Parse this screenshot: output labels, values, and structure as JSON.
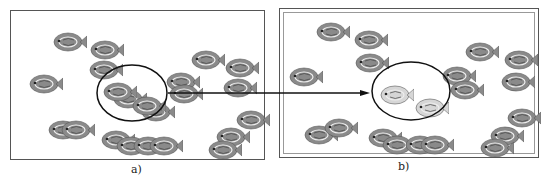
{
  "panels": [
    {
      "id": "a",
      "label": "a)"
    },
    {
      "id": "b",
      "label": "b)"
    }
  ],
  "colors": {
    "fish_normal": "#8a8a8a",
    "fish_faded": "#d6d6d6",
    "outline": "#111111"
  },
  "fish_a": [
    [
      42,
      20
    ],
    [
      79,
      28
    ],
    [
      78,
      48
    ],
    [
      18,
      62
    ],
    [
      180,
      38
    ],
    [
      214,
      46
    ],
    [
      212,
      66
    ],
    [
      155,
      60
    ],
    [
      158,
      72
    ],
    [
      102,
      77
    ],
    [
      130,
      90
    ],
    [
      37,
      108
    ],
    [
      50,
      108
    ],
    [
      90,
      118
    ],
    [
      105,
      124
    ],
    [
      122,
      124
    ],
    [
      138,
      124
    ],
    [
      225,
      98
    ],
    [
      205,
      115
    ],
    [
      197,
      128
    ]
  ],
  "fish_b": [
    [
      36,
      12
    ],
    [
      74,
      20
    ],
    [
      75,
      43
    ],
    [
      9,
      57
    ],
    [
      185,
      32
    ],
    [
      224,
      40
    ],
    [
      221,
      62
    ],
    [
      162,
      56
    ],
    [
      170,
      70
    ],
    [
      24,
      115
    ],
    [
      44,
      108
    ],
    [
      88,
      118
    ],
    [
      102,
      125
    ],
    [
      125,
      125
    ],
    [
      140,
      125
    ],
    [
      227,
      98
    ],
    [
      210,
      116
    ],
    [
      200,
      128
    ]
  ],
  "highlighted_fish_b": [
    [
      100,
      75
    ],
    [
      135,
      88
    ]
  ]
}
